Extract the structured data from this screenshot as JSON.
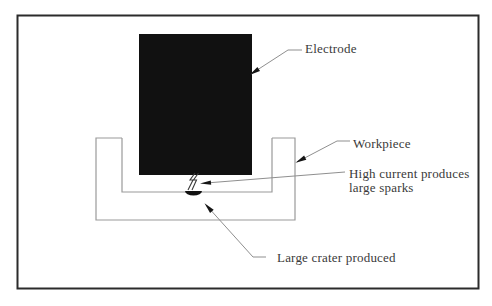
{
  "figure": {
    "type": "process-diagram",
    "labels": {
      "electrode": "Electrode",
      "workpiece": "Workpiece",
      "spark_line1": "High current produces",
      "spark_line2": "large sparks",
      "crater": "Large crater produced"
    },
    "colors": {
      "background": "#ffffff",
      "frame_border": "#2b2b2b",
      "electrode_fill": "#111111",
      "workpiece_outline": "#9a9a9a",
      "leader_line": "#8f8f8f",
      "arrowhead": "#151515",
      "spark_stroke": "#3a3a3a",
      "crater_fill": "#111111",
      "text": "#3a3a3a"
    }
  }
}
